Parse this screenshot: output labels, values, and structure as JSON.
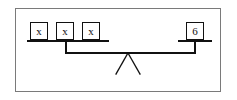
{
  "diagram": {
    "type": "balance-scale",
    "frame": {
      "visible": true,
      "border_color": "#7a7a7a"
    },
    "line_color": "#111111",
    "left_pan": {
      "label": "left-pan",
      "weights": [
        {
          "id": "weight-1",
          "label": "x"
        },
        {
          "id": "weight-2",
          "label": "x"
        },
        {
          "id": "weight-3",
          "label": "x"
        }
      ]
    },
    "right_pan": {
      "label": "right-pan",
      "weights": [
        {
          "id": "weight-4",
          "label": "6"
        }
      ]
    },
    "fulcrum": {
      "label": "fulcrum"
    },
    "beam": {
      "label": "beam"
    }
  }
}
